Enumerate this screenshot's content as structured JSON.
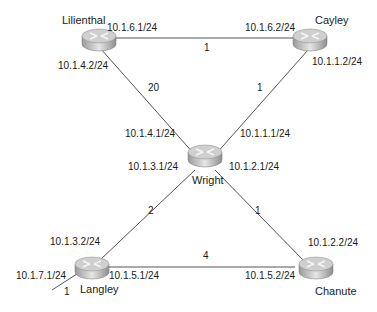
{
  "routers": {
    "lilienthal": {
      "name": "Lilienthal"
    },
    "cayley": {
      "name": "Cayley"
    },
    "wright": {
      "name": "Wright"
    },
    "langley": {
      "name": "Langley"
    },
    "chanute": {
      "name": "Chanute"
    }
  },
  "interfaces": {
    "lilienthal_cayley": "10.1.6.1/24",
    "cayley_lilienthal": "10.1.6.2/24",
    "lilienthal_wright": "10.1.4.2/24",
    "wright_lilienthal": "10.1.4.1/24",
    "cayley_wright": "10.1.1.2/24",
    "wright_cayley": "10.1.1.1/24",
    "wright_langley": "10.1.3.1/24",
    "langley_wright": "10.1.3.2/24",
    "wright_chanute": "10.1.2.1/24",
    "chanute_wright": "10.1.2.2/24",
    "langley_chanute": "10.1.5.1/24",
    "chanute_langley": "10.1.5.2/24",
    "langley_external": "10.1.7.1/24"
  },
  "costs": {
    "lilienthal_cayley": "1",
    "lilienthal_wright": "20",
    "cayley_wright": "1",
    "wright_langley": "2",
    "wright_chanute": "1",
    "langley_chanute": "4",
    "langley_external": "1"
  },
  "colors": {
    "link": "#555555",
    "router_top": "#d8d8d8",
    "router_side": "#a8a8a8"
  }
}
